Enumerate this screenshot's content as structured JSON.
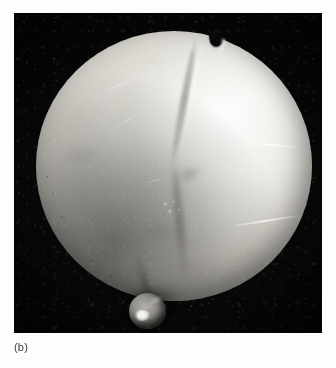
{
  "figure": {
    "caption": "(b)",
    "background_color": "#fdfdfd",
    "plate": {
      "name": "photographic-plate",
      "background_color": "#060606",
      "bounds": {
        "x": 14,
        "y": 13,
        "width": 308,
        "height": 320
      }
    },
    "subject": {
      "label": "illuminated-sphere",
      "description": "Large brightly lit spherical specimen filling the dark photographic plate",
      "bounds": {
        "x": 36,
        "y": 31,
        "width": 276,
        "height": 270
      },
      "surface_color": "#d8d6cf",
      "highlight_color": "#ffffff",
      "shadow_color": "#5d5a55",
      "features": [
        {
          "name": "top-notch",
          "description": "V-shaped notch cut into the upper limb"
        },
        {
          "name": "diagonal-seam",
          "description": "Darker ridge running from the top notch down toward the lower left"
        },
        {
          "name": "defect-cluster",
          "description": "Small bright pitted cluster near the lower middle of the seam"
        },
        {
          "name": "surface-scratches",
          "description": "Thin bright scratch lines, most visible near the right limb"
        },
        {
          "name": "rough-limb",
          "description": "Jagged, irregular edge along the lower-left limb"
        }
      ]
    },
    "marker_ball": {
      "label": "metallic-reference-ball",
      "description": "Small dark metallic sphere with a bright specular highlight resting at the lower-left of the specimen",
      "bounds": {
        "x": 115,
        "y": 280,
        "width": 37,
        "height": 36
      },
      "body_color": "#4f4d49",
      "highlight_color": "#ffffff"
    }
  }
}
